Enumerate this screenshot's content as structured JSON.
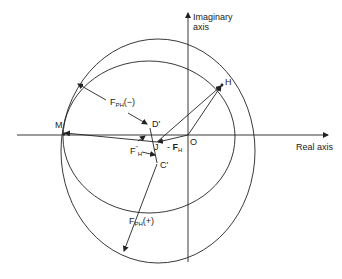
{
  "diagram": {
    "type": "harker-construction",
    "axes": {
      "imaginary_label_line1": "Imaginary",
      "imaginary_label_line2": "axis",
      "real_label": "Real axis"
    },
    "points": {
      "M": "M",
      "H": "H",
      "O": "O",
      "J": "J",
      "D_prime": "D'",
      "C_prime": "C'"
    },
    "vectors": {
      "fph_minus_main": "F",
      "fph_minus_sub": "PH",
      "fph_minus_sign": "(−)",
      "fph_plus_main": "F",
      "fph_plus_sub": "PH",
      "fph_plus_sign": "(+)",
      "fh_double_prime_main": "F",
      "fh_double_prime_sup": "\"",
      "fh_double_prime_sub": "H",
      "neg_fh_prefix": "- ",
      "neg_fh_main": "F",
      "neg_fh_sub": "H"
    },
    "colors": {
      "line": "#222222",
      "background": "#ffffff"
    }
  }
}
